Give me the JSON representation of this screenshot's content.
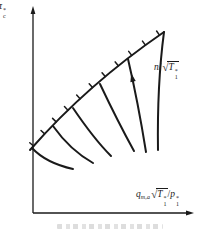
{
  "colors": {
    "ink": "#1a1a1a",
    "caption_gray": "#cbcbcb",
    "background": "#ffffff"
  },
  "labels": {
    "y_axis": {
      "base": "π",
      "sup": "*",
      "sub": "c"
    },
    "speed": {
      "prefix": "n",
      "slash": "/",
      "radical": "√",
      "radicand": "T",
      "sup": "*",
      "sub": "1"
    },
    "x_axis": {
      "flow": "q",
      "flow_sub": "m,a",
      "radical": "√",
      "radicand": "T",
      "rad_sup": "*",
      "rad_sub": "1",
      "slash": "/",
      "pressure": "p",
      "p_sup": "*",
      "p_sub": "1"
    }
  },
  "diagram": {
    "axes": {
      "origin": [
        33,
        213
      ],
      "y_top": 12,
      "x_right": 188,
      "stroke_width": 1.3
    },
    "surge_line": {
      "start": [
        30,
        150
      ],
      "ctrl": [
        88,
        84
      ],
      "end": [
        164,
        32
      ],
      "stroke_width": 2,
      "hatch_count": 11,
      "hatch_len": 5
    },
    "speed_lines": [
      {
        "start": [
          32,
          148
        ],
        "ctrl": [
          46,
          163
        ],
        "end": [
          73,
          169
        ]
      },
      {
        "start": [
          53,
          126
        ],
        "ctrl": [
          70,
          150
        ],
        "end": [
          93,
          163
        ]
      },
      {
        "start": [
          73,
          108
        ],
        "ctrl": [
          94,
          139
        ],
        "end": [
          111,
          156
        ]
      },
      {
        "start": [
          100,
          84
        ],
        "ctrl": [
          118,
          122
        ],
        "end": [
          134,
          151
        ]
      },
      {
        "start": [
          128,
          59
        ],
        "ctrl": [
          138,
          102
        ],
        "end": [
          146,
          152
        ]
      },
      {
        "start": [
          164,
          32
        ],
        "ctrl": [
          157,
          85
        ],
        "end": [
          158,
          150
        ]
      }
    ],
    "speed_lines_stroke_width": 2,
    "direction_arrow": {
      "curve_index": 4,
      "t": 0.22,
      "size": 5
    }
  }
}
